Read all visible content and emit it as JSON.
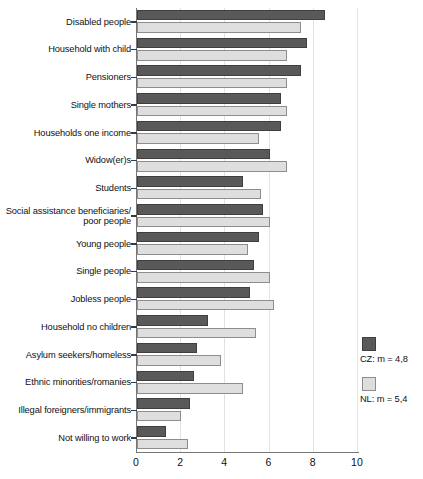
{
  "chart_data": {
    "type": "bar",
    "orientation": "horizontal",
    "title": "",
    "subtitle": "",
    "xlabel": "",
    "ylabel": "",
    "xlim": [
      0,
      10
    ],
    "xticks": [
      "0",
      "2",
      "4",
      "6",
      "8",
      "10"
    ],
    "xtick_values": [
      0,
      2,
      4,
      6,
      8,
      10
    ],
    "grid": true,
    "grid_axis": "x",
    "legend_position": "right",
    "categories": [
      "Disabled people",
      "Household with child",
      "Pensioners",
      "Single mothers",
      "Households one income",
      "Widow(er)s",
      "Students",
      "Social assistance beneficiaries/\npoor people",
      "Young people",
      "Single people",
      "Jobless people",
      "Household no children",
      "Asylum seekers/homeless",
      "Ethnic minorities/romanies",
      "Illegal foreigners/immigrants",
      "Not willing to work"
    ],
    "series": [
      {
        "name": "CZ",
        "legend_label": "CZ: m = 4,8",
        "mean": 4.8,
        "color": "#595959",
        "values": [
          8.5,
          7.7,
          7.4,
          6.5,
          6.5,
          6.0,
          4.8,
          5.7,
          5.5,
          5.3,
          5.1,
          3.2,
          2.7,
          2.6,
          2.4,
          1.3
        ]
      },
      {
        "name": "NL",
        "legend_label": "NL: m = 5,4",
        "mean": 5.4,
        "color": "#dedede",
        "values": [
          7.4,
          6.8,
          6.8,
          6.8,
          5.5,
          6.8,
          5.6,
          6.0,
          5.0,
          6.0,
          6.2,
          5.4,
          3.8,
          4.8,
          2.0,
          2.3
        ]
      }
    ]
  },
  "legend": {
    "items": [
      {
        "label": "CZ: m = 4,8",
        "swatch": "cz"
      },
      {
        "label": "NL: m = 5,4",
        "swatch": "nl"
      }
    ]
  }
}
